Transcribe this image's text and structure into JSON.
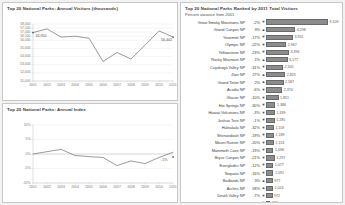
{
  "dashboard": {
    "accent_color": "#8c8c8c",
    "background": "#f2f2f2"
  },
  "chart_data": [
    {
      "type": "line",
      "title": "Top 20 National Parks:  Annual Visitors (thousands)",
      "xlabel": "",
      "ylabel": "",
      "grid": true,
      "legend": "none",
      "categories": [
        "2001",
        "2002",
        "2003",
        "2004",
        "2005",
        "2006",
        "2007",
        "2008",
        "2009",
        "2010",
        "2011"
      ],
      "values": [
        56950,
        57400,
        56400,
        56500,
        56250,
        53400,
        54500,
        53700,
        55400,
        57150,
        56400
      ],
      "ytick_labels": [
        "$8,000",
        "$4,000",
        "$7,000",
        "$6,000",
        "$5,000",
        "$4,000",
        "$3,000",
        "$2,000",
        "$1,000",
        "$6,000"
      ],
      "ylim": [
        51000,
        58000
      ],
      "yticks": [
        58000,
        57500,
        57000,
        56500,
        56000,
        55000,
        54000,
        53000,
        52000,
        51000
      ],
      "ytick_text": [
        "58,000",
        "57,500",
        "57,000",
        "56,500",
        "56,000",
        "55,000",
        "54,000",
        "53,000",
        "52,000",
        "51,000"
      ],
      "annotations": [
        {
          "label": "56,950",
          "x": "2001",
          "y": 56950
        },
        {
          "label": "56,402",
          "x": "2011",
          "y": 56400
        }
      ]
    },
    {
      "type": "line",
      "title": "Top 20 National Parks:  Annual Index",
      "xlabel": "",
      "ylabel": "",
      "grid": true,
      "legend": "none",
      "categories": [
        "2001",
        "2002",
        "2003",
        "2004",
        "2005",
        "2006",
        "2007",
        "2008",
        "2009",
        "2010",
        "2011"
      ],
      "values": [
        0,
        0.8,
        1.6,
        -0.5,
        -0.9,
        -1.2,
        -4.0,
        -2.4,
        -3.3,
        -1.2,
        0.6
      ],
      "ylim": [
        -10,
        10
      ],
      "yticks": [
        10,
        5,
        0,
        -5,
        -10
      ],
      "ytick_text": [
        "10%",
        "5%",
        "0%",
        "-5%",
        "-10%"
      ],
      "annotations": [
        {
          "label": "-1%",
          "x": "2011",
          "y": -1.0
        }
      ]
    },
    {
      "type": "bar",
      "orientation": "horizontal",
      "title": "Top 20 National Parks Ranked by 2011 Total Visitors",
      "subtitle": "Percent variance from 2001",
      "xlabel": "",
      "ylabel": "",
      "grid": false,
      "legend": "none",
      "columns": [
        "Park",
        "Percent variance from 2001",
        "Trend",
        "2011 Total Visitors"
      ],
      "categories": [
        "Great Smoky Mountains NP",
        "Grand Canyon NP",
        "Yosemite NP",
        "Olympic NP",
        "Yellowstone NP",
        "Rocky Mountain NP",
        "Cuyahoga Valley NP",
        "Zion NP",
        "Grand Teton NP",
        "Acadia NP",
        "Glacier NP",
        "Hot Springs NP",
        "Hawaii Volcanoes NP",
        "Joshua Tree NP",
        "Haleakala NP",
        "Shenandoah NP",
        "Mount Rainier NP",
        "Mammoth Cave NP",
        "Bryce Canyon NP",
        "Everglades NP",
        "Sequoia NP",
        "Badlands NP",
        "Arches NP",
        "Death Valley NP",
        "Saguaro NP",
        "Wind Cave NP",
        "Virgin Islands NP",
        "Petrified Forest NP",
        "Capitol Reef NP"
      ],
      "values": [
        9109,
        4298,
        3951,
        2967,
        3394,
        3177,
        2505,
        2825,
        2587,
        2374,
        1851,
        1386,
        1339,
        1285,
        1159,
        1189,
        1153,
        1096,
        1297,
        1077,
        1091,
        977,
        1024,
        972,
        661,
        616,
        448,
        579,
        663
      ],
      "value_labels": [
        "9,109",
        "4,298",
        "3,951",
        "2,967",
        "3,394",
        "3,177",
        "2,505",
        "2,825",
        "2,587",
        "2,374",
        "1,851",
        "1,386",
        "1,339",
        "1,285",
        "1,159",
        "1,189",
        "1,153",
        "1,096",
        "1,297",
        "1,077",
        "1,091",
        "977",
        "1,024",
        "972",
        "661",
        "616",
        "448",
        "579",
        "663"
      ],
      "percent_labels": [
        "-2%",
        "3%",
        "-17%",
        "-22%",
        "-23%",
        "1%",
        "-31%",
        "27%",
        "2%",
        "-6%",
        "-10%",
        "-30%",
        "-3%",
        "-1%",
        "-32%",
        "-19%",
        "-20%",
        "-19%",
        "-21%",
        "-12%",
        "-16%",
        "3%",
        "58%",
        "-7%",
        "-18%",
        "-16%",
        "-17%",
        "-33%",
        "-5%",
        "-17%"
      ],
      "trend_arrows": [
        "down",
        "up",
        "down",
        "down",
        "down",
        "up",
        "down",
        "up",
        "up",
        "down",
        "down",
        "down",
        "down",
        "down",
        "down",
        "down",
        "down",
        "down",
        "down",
        "down",
        "down",
        "up",
        "up",
        "down",
        "down",
        "down",
        "down",
        "down",
        "up",
        "down"
      ]
    }
  ]
}
